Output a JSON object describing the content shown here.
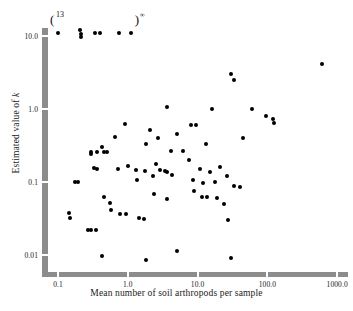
{
  "figure": {
    "background": "#ffffff",
    "point_color": "#000000",
    "axis_color": "#8c8c8c"
  },
  "axes": {
    "x_title": "Mean number of soil arthropods per sample",
    "y_title_prefix": "Estimated value of ",
    "y_title_symbol": "k",
    "x_ticks": [
      "0.1",
      "1.0",
      "10.0",
      "100.0",
      "1000.0"
    ],
    "y_ticks": [
      "10.0",
      "1.0",
      "0.1",
      "0.01"
    ]
  },
  "annotations": [
    {
      "name": "left-group-count",
      "text": "13",
      "open_paren": "("
    },
    {
      "name": "right-group-infinity",
      "text": "∞",
      "close_paren": ")"
    }
  ],
  "chart_data": {
    "type": "scatter",
    "title": "",
    "xlabel": "Mean number of soil arthropods per sample",
    "ylabel": "Estimated value of k",
    "xscale": "log",
    "yscale": "log",
    "xlim": [
      0.055,
      1400
    ],
    "ylim": [
      0.006,
      14
    ],
    "grid": false,
    "legend": null,
    "marker": "filled-circle",
    "notes": [
      "Points plotted at the very top of the frame are censored/off-scale values.",
      "The '(13' annotation marks a cluster of 13 coincident off-scale points at the left.",
      "The ')∞' annotation marks off-scale points with infinite estimated k."
    ],
    "offscale_points_x": [
      0.1,
      0.21,
      0.215,
      0.215,
      0.34,
      0.4,
      0.75,
      1.1
    ],
    "points": [
      {
        "x": 0.1,
        "y": 11.0
      },
      {
        "x": 0.21,
        "y": 12.0
      },
      {
        "x": 0.212,
        "y": 10.6
      },
      {
        "x": 0.214,
        "y": 9.6
      },
      {
        "x": 0.34,
        "y": 11.0
      },
      {
        "x": 0.4,
        "y": 11.0
      },
      {
        "x": 0.75,
        "y": 11.0
      },
      {
        "x": 1.1,
        "y": 11.0
      },
      {
        "x": 30.0,
        "y": 3.0
      },
      {
        "x": 33.0,
        "y": 2.5
      },
      {
        "x": 600.0,
        "y": 4.2
      },
      {
        "x": 0.9,
        "y": 0.62
      },
      {
        "x": 0.66,
        "y": 0.42
      },
      {
        "x": 0.42,
        "y": 0.3
      },
      {
        "x": 0.3,
        "y": 0.24
      },
      {
        "x": 3.6,
        "y": 1.05
      },
      {
        "x": 8.0,
        "y": 0.6
      },
      {
        "x": 9.5,
        "y": 0.6
      },
      {
        "x": 16.0,
        "y": 1.0
      },
      {
        "x": 60.0,
        "y": 1.0
      },
      {
        "x": 95.0,
        "y": 0.8
      },
      {
        "x": 120.0,
        "y": 0.72
      },
      {
        "x": 125.0,
        "y": 0.64
      },
      {
        "x": 2.1,
        "y": 0.52
      },
      {
        "x": 2.7,
        "y": 0.4
      },
      {
        "x": 1.85,
        "y": 0.33
      },
      {
        "x": 5.0,
        "y": 0.45
      },
      {
        "x": 4.2,
        "y": 0.27
      },
      {
        "x": 6.2,
        "y": 0.27
      },
      {
        "x": 13.0,
        "y": 0.33
      },
      {
        "x": 45.0,
        "y": 0.4
      },
      {
        "x": 0.3,
        "y": 0.26
      },
      {
        "x": 0.36,
        "y": 0.255
      },
      {
        "x": 0.46,
        "y": 0.26
      },
      {
        "x": 0.5,
        "y": 0.255
      },
      {
        "x": 0.33,
        "y": 0.155
      },
      {
        "x": 0.36,
        "y": 0.15
      },
      {
        "x": 0.72,
        "y": 0.15
      },
      {
        "x": 1.0,
        "y": 0.165
      },
      {
        "x": 1.3,
        "y": 0.145
      },
      {
        "x": 1.75,
        "y": 0.14
      },
      {
        "x": 2.5,
        "y": 0.175
      },
      {
        "x": 2.9,
        "y": 0.145
      },
      {
        "x": 3.4,
        "y": 0.14
      },
      {
        "x": 3.7,
        "y": 0.138
      },
      {
        "x": 7.5,
        "y": 0.2
      },
      {
        "x": 11.0,
        "y": 0.15
      },
      {
        "x": 15.0,
        "y": 0.135
      },
      {
        "x": 21.0,
        "y": 0.16
      },
      {
        "x": 0.175,
        "y": 0.1
      },
      {
        "x": 0.195,
        "y": 0.1
      },
      {
        "x": 1.35,
        "y": 0.105
      },
      {
        "x": 2.3,
        "y": 0.12
      },
      {
        "x": 4.3,
        "y": 0.125
      },
      {
        "x": 8.5,
        "y": 0.105
      },
      {
        "x": 12.0,
        "y": 0.098
      },
      {
        "x": 18.0,
        "y": 0.1
      },
      {
        "x": 26.0,
        "y": 0.12
      },
      {
        "x": 33.0,
        "y": 0.088
      },
      {
        "x": 40.0,
        "y": 0.085
      },
      {
        "x": 0.46,
        "y": 0.062
      },
      {
        "x": 0.55,
        "y": 0.052
      },
      {
        "x": 0.58,
        "y": 0.042
      },
      {
        "x": 2.4,
        "y": 0.068
      },
      {
        "x": 3.6,
        "y": 0.058
      },
      {
        "x": 9.0,
        "y": 0.075
      },
      {
        "x": 11.5,
        "y": 0.062
      },
      {
        "x": 13.5,
        "y": 0.062
      },
      {
        "x": 19.0,
        "y": 0.06
      },
      {
        "x": 24.0,
        "y": 0.05
      },
      {
        "x": 0.145,
        "y": 0.038
      },
      {
        "x": 0.147,
        "y": 0.032
      },
      {
        "x": 0.78,
        "y": 0.036
      },
      {
        "x": 0.95,
        "y": 0.036
      },
      {
        "x": 1.45,
        "y": 0.032
      },
      {
        "x": 1.7,
        "y": 0.031
      },
      {
        "x": 27.0,
        "y": 0.03
      },
      {
        "x": 0.265,
        "y": 0.022
      },
      {
        "x": 0.3,
        "y": 0.022
      },
      {
        "x": 0.345,
        "y": 0.022
      },
      {
        "x": 0.42,
        "y": 0.0098
      },
      {
        "x": 1.8,
        "y": 0.0085
      },
      {
        "x": 5.0,
        "y": 0.0115
      },
      {
        "x": 30.0,
        "y": 0.009
      }
    ]
  }
}
